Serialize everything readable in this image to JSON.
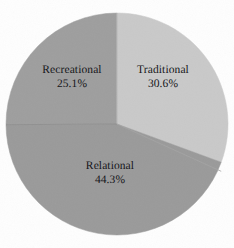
{
  "chart_data": {
    "type": "pie",
    "title": "",
    "subtitle": "",
    "xlabel": "",
    "ylabel": "",
    "legend_position": "none",
    "grid": false,
    "labels_inside_slices": true,
    "start_angle_deg": 0,
    "direction": "clockwise",
    "categories": [
      "Traditional",
      "Relational",
      "Recreational"
    ],
    "values": [
      30.6,
      44.3,
      25.1
    ],
    "value_unit": "%",
    "slices": [
      {
        "name": "Traditional",
        "label": "Traditional",
        "value": 30.6,
        "percent_text": "30.6%",
        "color": "#c9c9c9",
        "start_angle_deg": 0,
        "end_angle_deg": 110.16
      },
      {
        "name": "Relational",
        "label": "Relational",
        "value": 44.3,
        "percent_text": "44.3%",
        "color": "#9a9a9a",
        "start_angle_deg": 110.16,
        "end_angle_deg": 269.64
      },
      {
        "name": "Recreational",
        "label": "Recreational",
        "value": 25.1,
        "percent_text": "25.1%",
        "color": "#9e9e9e",
        "start_angle_deg": 269.64,
        "end_angle_deg": 360
      }
    ]
  },
  "colors": {
    "background": "#fefefe",
    "text": "#16161a",
    "slice_traditional": "#c9c9c9",
    "slice_relational": "#9a9a9a",
    "slice_recreational": "#9e9e9e",
    "divider": "#8c8c8c"
  }
}
